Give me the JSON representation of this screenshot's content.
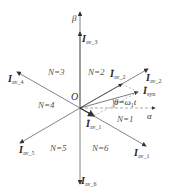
{
  "diagram": {
    "origin_label": "O",
    "axes": {
      "alpha": "α",
      "beta": "β"
    },
    "vectors": [
      {
        "name": "I",
        "sub": "av_1",
        "angle_deg": -30
      },
      {
        "name": "I",
        "sub": "av_2",
        "angle_deg": 30
      },
      {
        "name": "I",
        "sub": "av_3",
        "angle_deg": 90
      },
      {
        "name": "I",
        "sub": "av_4",
        "angle_deg": 150
      },
      {
        "name": "I",
        "sub": "av_5",
        "angle_deg": 210
      },
      {
        "name": "I",
        "sub": "av_6",
        "angle_deg": 270
      }
    ],
    "reference_vectors": [
      {
        "name": "I",
        "sup": "*",
        "sub": "av_2"
      },
      {
        "name": "I",
        "sup": "*",
        "sub": "syn"
      },
      {
        "name": "I",
        "sup": "*",
        "sub": "av_1"
      }
    ],
    "sectors": [
      "N=1",
      "N=2",
      "N=3",
      "N=4",
      "N=5",
      "N=6"
    ],
    "angle_label": {
      "theta": "θ",
      "eq": "=",
      "omega": "ω",
      "omega_sub": "1",
      "t": "t"
    },
    "colors": {
      "lines": "#666666",
      "dashed": "#888888",
      "text": "#333333"
    }
  }
}
